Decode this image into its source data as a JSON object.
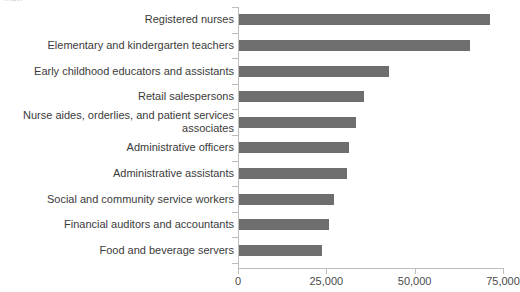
{
  "title_remnant": "men",
  "chart_data": {
    "type": "bar",
    "orientation": "horizontal",
    "title": "",
    "subtitle": "",
    "xlabel": "",
    "ylabel": "",
    "grid": false,
    "legend": "none",
    "xlim": [
      0,
      75000
    ],
    "xticks": [
      0,
      25000,
      50000,
      75000
    ],
    "xtick_labels": [
      "0",
      "25,000",
      "50,000",
      "75,000"
    ],
    "bar_color": "#6e6e6e",
    "axis_color": "#bdbdbd",
    "label_color": "#3b3b3b",
    "categories": [
      "Registered nurses",
      "Elementary and kindergarten teachers",
      "Early childhood educators and assistants",
      "Retail salespersons",
      "Nurse aides, orderlies, and patient services\nassociates",
      "Administrative officers",
      "Administrative assistants",
      "Social and community service workers",
      "Financial auditors and accountants",
      "Food and beverage servers"
    ],
    "values": [
      71000,
      65500,
      42500,
      35500,
      33000,
      31000,
      30500,
      27000,
      25500,
      23500
    ],
    "series": [
      {
        "name": "Count",
        "values": [
          71000,
          65500,
          42500,
          35500,
          33000,
          31000,
          30500,
          27000,
          25500,
          23500
        ]
      }
    ]
  }
}
